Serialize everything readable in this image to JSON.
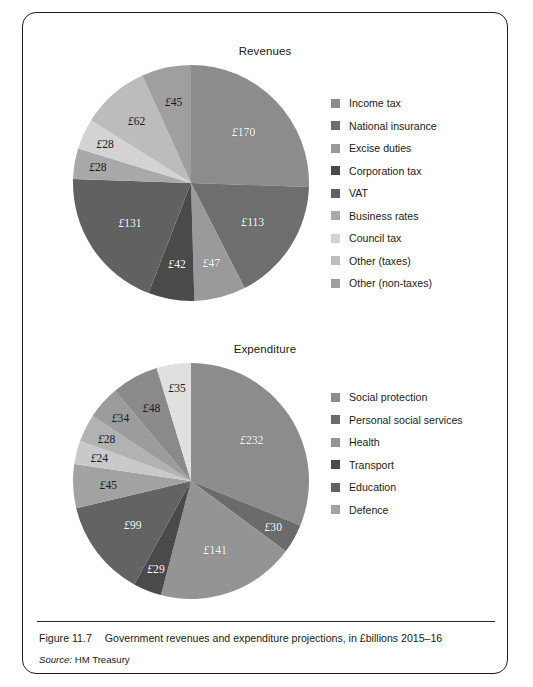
{
  "figure": {
    "caption_number": "Figure 11.7",
    "caption_text": "Government revenues and expenditure projections, in £billions 2015–16",
    "source_label": "Source:",
    "source_value": "HM Treasury"
  },
  "revenues": {
    "title": "Revenues",
    "legend": [
      {
        "label": "Income tax",
        "color": "#8c8c8c"
      },
      {
        "label": "National insurance",
        "color": "#6e6e6e"
      },
      {
        "label": "Excise duties",
        "color": "#9a9a9a"
      },
      {
        "label": "Corporation tax",
        "color": "#4a4a4a"
      },
      {
        "label": "VAT",
        "color": "#616161"
      },
      {
        "label": "Business rates",
        "color": "#a9a9a9"
      },
      {
        "label": "Council tax",
        "color": "#d3d3d3"
      },
      {
        "label": "Other (taxes)",
        "color": "#bcbcbc"
      },
      {
        "label": "Other (non-taxes)",
        "color": "#9f9f9f"
      }
    ]
  },
  "expenditure": {
    "title": "Expenditure",
    "legend": [
      {
        "label": "Social protection",
        "color": "#8c8c8c"
      },
      {
        "label": "Personal social services",
        "color": "#6b6b6b"
      },
      {
        "label": "Health",
        "color": "#949494"
      },
      {
        "label": "Transport",
        "color": "#4a4a4a"
      },
      {
        "label": "Education",
        "color": "#636363"
      },
      {
        "label": "Defence",
        "color": "#a2a2a2"
      }
    ]
  },
  "chart_data": [
    {
      "type": "pie",
      "title": "Revenues",
      "unit": "£ billions",
      "total": 666,
      "start_angle_deg": 0,
      "direction": "clockwise",
      "legend_position": "right",
      "categories": [
        "Income tax",
        "National insurance",
        "Excise duties",
        "Corporation tax",
        "VAT",
        "Business rates",
        "Council tax",
        "Other (taxes)",
        "Other (non-taxes)"
      ],
      "values": [
        170,
        113,
        47,
        42,
        131,
        28,
        28,
        62,
        45
      ],
      "labels": [
        "£170",
        "£113",
        "£47",
        "£42",
        "£131",
        "£28",
        "£28",
        "£62",
        "£45"
      ],
      "colors": [
        "#8c8c8c",
        "#6e6e6e",
        "#9a9a9a",
        "#4a4a4a",
        "#616161",
        "#a9a9a9",
        "#d3d3d3",
        "#bcbcbc",
        "#9f9f9f"
      ]
    },
    {
      "type": "pie",
      "title": "Expenditure",
      "unit": "£ billions",
      "total": 715,
      "start_angle_deg": 0,
      "direction": "clockwise",
      "legend_position": "right",
      "categories": [
        "Social protection",
        "Personal social services",
        "Health",
        "Transport",
        "Education",
        "Defence",
        "Other 1",
        "Other 2",
        "Other 3",
        "Other 4",
        "Other 5"
      ],
      "values": [
        232,
        30,
        141,
        29,
        99,
        45,
        24,
        28,
        34,
        48,
        35
      ],
      "labels": [
        "£232",
        "£30",
        "£141",
        "£29",
        "£99",
        "£45",
        "£24",
        "£28",
        "£34",
        "£48",
        "£35"
      ],
      "colors": [
        "#8c8c8c",
        "#6b6b6b",
        "#949494",
        "#4a4a4a",
        "#636363",
        "#a2a2a2",
        "#c9c9c9",
        "#b2b2b2",
        "#9c9c9c",
        "#8a8a8a",
        "#e0e0e0"
      ]
    }
  ]
}
